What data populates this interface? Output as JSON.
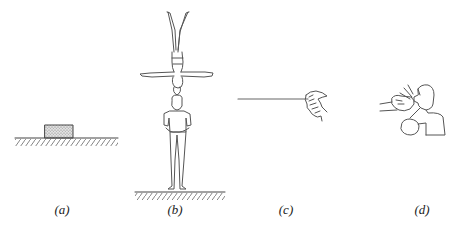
{
  "panels": [
    {
      "id": "a",
      "label": "(a)",
      "depicts": "block resting on ground"
    },
    {
      "id": "b",
      "label": "(b)",
      "depicts": "acrobat balanced head-to-head on standing man"
    },
    {
      "id": "c",
      "label": "(c)",
      "depicts": "hand pulling a rope"
    },
    {
      "id": "d",
      "label": "(d)",
      "depicts": "boxer punched in the face"
    }
  ],
  "colors": {
    "line": "#555555",
    "background": "#ffffff",
    "block_fill": "#cfcfcf"
  }
}
